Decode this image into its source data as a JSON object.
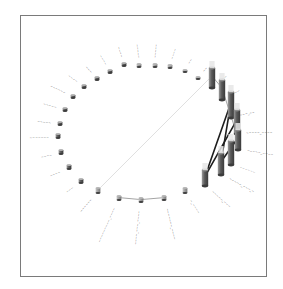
{
  "diagram": {
    "type": "3d-circular-network",
    "frame": {
      "x": 20,
      "y": 15,
      "w": 247,
      "h": 262,
      "border": "#7a7a7a"
    },
    "colors": {
      "node_light": "#bdbdbd",
      "node_mid": "#8a8a8a",
      "node_dark": "#4a4a4a",
      "bar_top": "#e6e6e6",
      "edge_light": "#e0e0e0",
      "edge_mid": "#9a9a9a",
      "edge_dark": "#1e1e1e",
      "label": "#555555"
    },
    "nodes": [
      {
        "id": 0,
        "x": 124,
        "y": 66,
        "h": 3,
        "label": "~~~~"
      },
      {
        "id": 1,
        "x": 139,
        "y": 67,
        "h": 3,
        "label": "~~~~~"
      },
      {
        "id": 2,
        "x": 155,
        "y": 67,
        "h": 3,
        "label": "~~~~~"
      },
      {
        "id": 3,
        "x": 170,
        "y": 68,
        "h": 3,
        "label": "~~~~"
      },
      {
        "id": 4,
        "x": 185,
        "y": 72,
        "h": 2,
        "label": "~~"
      },
      {
        "id": 5,
        "x": 198,
        "y": 79,
        "h": 2,
        "label": "~~"
      },
      {
        "id": 6,
        "x": 212,
        "y": 88,
        "h": 20,
        "label": "~_~~"
      },
      {
        "id": 7,
        "x": 222,
        "y": 100,
        "h": 20,
        "label": "~~~~"
      },
      {
        "id": 8,
        "x": 231,
        "y": 118,
        "h": 26,
        "label": "~~~_~~"
      },
      {
        "id": 9,
        "x": 237,
        "y": 134,
        "h": 24,
        "label": "~~~~~_~~~~"
      },
      {
        "id": 10,
        "x": 238,
        "y": 150,
        "h": 20,
        "label": "~~~~~_~~~~"
      },
      {
        "id": 11,
        "x": 231,
        "y": 165,
        "h": 24,
        "label": "~~~~~~"
      },
      {
        "id": 12,
        "x": 221,
        "y": 175,
        "h": 22,
        "label": "~~~~~_~~~_~"
      },
      {
        "id": 13,
        "x": 205,
        "y": 186,
        "h": 16,
        "label": "~~~~~_~~~"
      },
      {
        "id": 14,
        "x": 185,
        "y": 193,
        "h": 5,
        "label": "~_~~~~"
      },
      {
        "id": 15,
        "x": 164,
        "y": 200,
        "h": 4,
        "label": "~~~~~~~_~~~~"
      },
      {
        "id": 16,
        "x": 141,
        "y": 202,
        "h": 4,
        "label": "~~~~_~~~_~~~~"
      },
      {
        "id": 17,
        "x": 119,
        "y": 200,
        "h": 4,
        "label": "~~~~~~~~~_~~~~"
      },
      {
        "id": 18,
        "x": 98,
        "y": 193,
        "h": 5,
        "label": "~~~~~~"
      },
      {
        "id": 19,
        "x": 81,
        "y": 183,
        "h": 4,
        "label": "~~~"
      },
      {
        "id": 20,
        "x": 69,
        "y": 169,
        "h": 4,
        "label": "~~~~"
      },
      {
        "id": 21,
        "x": 61,
        "y": 154,
        "h": 4,
        "label": "~~~~"
      },
      {
        "id": 22,
        "x": 58,
        "y": 138,
        "h": 4,
        "label": "~~~~~~~"
      },
      {
        "id": 23,
        "x": 60,
        "y": 125,
        "h": 3,
        "label": "~~~~~"
      },
      {
        "id": 24,
        "x": 65,
        "y": 111,
        "h": 3,
        "label": "~~~~~"
      },
      {
        "id": 25,
        "x": 73,
        "y": 98,
        "h": 3,
        "label": "~~~~~~"
      },
      {
        "id": 26,
        "x": 84,
        "y": 88,
        "h": 3,
        "label": "~~~~"
      },
      {
        "id": 27,
        "x": 97,
        "y": 80,
        "h": 3,
        "label": "~~~"
      },
      {
        "id": 28,
        "x": 110,
        "y": 73,
        "h": 3,
        "label": "~~~~"
      }
    ],
    "edges": [
      {
        "from": 6,
        "to": 18,
        "weight": "light"
      },
      {
        "from": 6,
        "to": 7,
        "weight": "mid"
      },
      {
        "from": 7,
        "to": 10,
        "weight": "mid"
      },
      {
        "from": 8,
        "to": 13,
        "weight": "dark"
      },
      {
        "from": 9,
        "to": 13,
        "weight": "dark"
      },
      {
        "from": 10,
        "to": 12,
        "weight": "dark"
      },
      {
        "from": 8,
        "to": 12,
        "weight": "dark"
      },
      {
        "from": 15,
        "to": 16,
        "weight": "mid"
      },
      {
        "from": 16,
        "to": 17,
        "weight": "mid"
      }
    ]
  }
}
